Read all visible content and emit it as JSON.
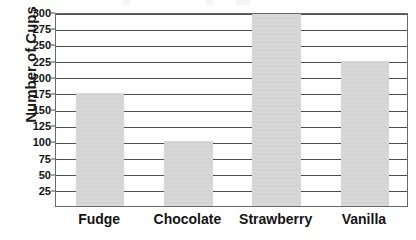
{
  "figure": {
    "background_color": "#ffffff",
    "bar_color": "#d4d4d4",
    "gridline_color": "#4d4d4d",
    "axis_color": "#6a6a6a",
    "text_color": "#111111"
  },
  "chart_data": {
    "type": "bar",
    "title": "",
    "xlabel": "",
    "ylabel": "Number of Cups",
    "categories": [
      "Fudge",
      "Chocolate",
      "Strawberry",
      "Vanilla"
    ],
    "values": [
      175,
      100,
      300,
      225
    ],
    "ylim": [
      0,
      300
    ],
    "ytick_step": 25,
    "yticks": [
      25,
      50,
      75,
      100,
      125,
      150,
      175,
      200,
      225,
      250,
      275,
      300
    ],
    "ytick_labels": [
      "25",
      "50",
      "75",
      "100",
      "125",
      "150",
      "175",
      "200",
      "225",
      "250",
      "275",
      "300"
    ],
    "grid": true,
    "grid_axis": "y",
    "legend": false,
    "orientation": "vertical",
    "bar_width_fraction": 0.55
  }
}
